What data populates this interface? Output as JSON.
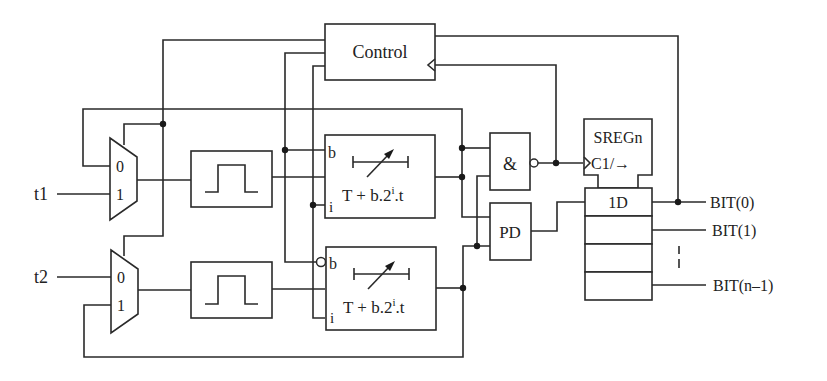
{
  "diagram": {
    "colors": {
      "line": "#2a2a2a",
      "background": "#ffffff"
    },
    "inputs": {
      "t1": "t1",
      "t2": "t2"
    },
    "control": {
      "label": "Control"
    },
    "mux": {
      "top": {
        "in0": "0",
        "in1": "1"
      },
      "bottom": {
        "in0": "0",
        "in1": "1"
      }
    },
    "delay_top": {
      "port_b": "b",
      "port_i": "i",
      "formula_main": "T + b.2",
      "formula_sup": "i",
      "formula_tail": ".t"
    },
    "delay_bottom": {
      "port_b": "b",
      "port_i": "i",
      "formula_main": "T + b.2",
      "formula_sup": "i",
      "formula_tail": ".t"
    },
    "and_gate": {
      "label": "&"
    },
    "phase_detector": {
      "label": "PD"
    },
    "register": {
      "title": "SREGn",
      "clock": "C1/→",
      "data": "1D"
    },
    "outputs": {
      "bit0": "BIT(0)",
      "bit1": "BIT(1)",
      "bitn": "BIT(n–1)"
    }
  }
}
